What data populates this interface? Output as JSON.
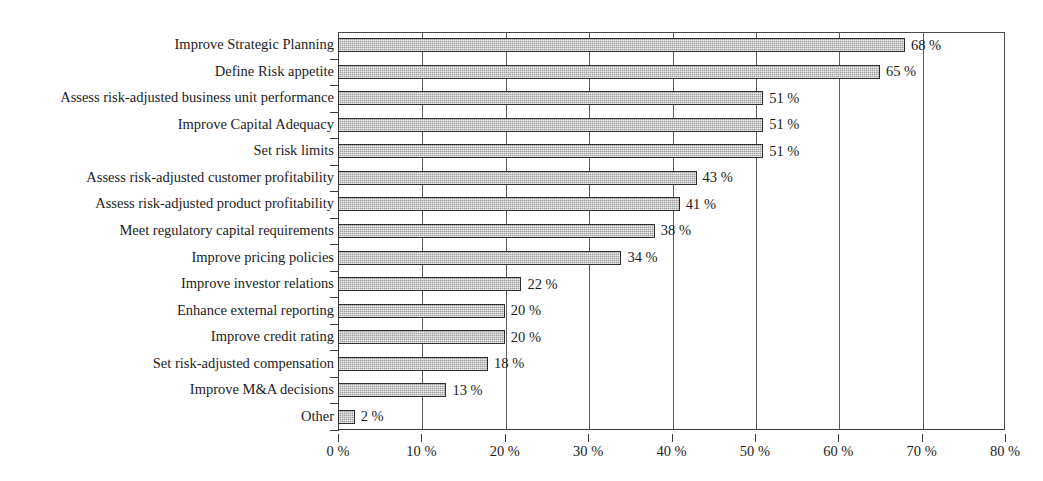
{
  "chart_data": {
    "type": "bar",
    "orientation": "horizontal",
    "title": "",
    "subtitle": "",
    "xlabel": "",
    "ylabel": "",
    "xlim": [
      0,
      80
    ],
    "grid": true,
    "legend": null,
    "value_suffix": " %",
    "categories": [
      "Improve Strategic Planning",
      "Define Risk appetite",
      "Assess risk-adjusted business unit performance",
      "Improve Capital Adequacy",
      "Set risk limits",
      "Assess risk-adjusted customer profitability",
      "Assess risk-adjusted product profitability",
      "Meet regulatory capital requirements",
      "Improve pricing policies",
      "Improve investor relations",
      "Enhance external reporting",
      "Improve credit rating",
      "Set risk-adjusted compensation",
      "Improve M&A decisions",
      "Other"
    ],
    "values": [
      68,
      65,
      51,
      51,
      51,
      43,
      41,
      38,
      34,
      22,
      20,
      20,
      18,
      13,
      2
    ],
    "data_labels": [
      "68 %",
      "65 %",
      "51 %",
      "51 %",
      "51 %",
      "43 %",
      "41 %",
      "38 %",
      "34 %",
      "22 %",
      "20 %",
      "20 %",
      "18 %",
      "13 %",
      "2 %"
    ],
    "xticks": [
      0,
      10,
      20,
      30,
      40,
      50,
      60,
      70,
      80
    ],
    "xtick_labels": [
      "0 %",
      "10 %",
      "20 %",
      "30 %",
      "40 %",
      "50 %",
      "60 %",
      "70 %",
      "80 %"
    ],
    "colors": {
      "bar_fill": "#9d9d9d",
      "bar_border": "#2e2e2e",
      "gridline": "#5e5e5e",
      "axis": "#3a3a3a",
      "text": "#1c1c1c",
      "background": "#ffffff"
    }
  }
}
